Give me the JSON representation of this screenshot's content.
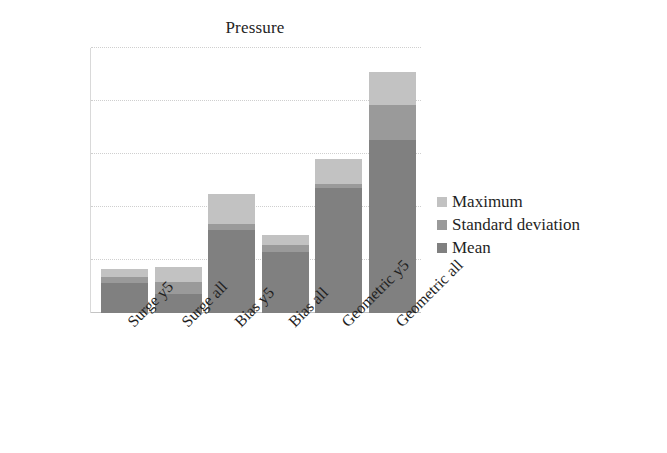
{
  "chart_data": {
    "type": "bar",
    "subtype": "stacked",
    "title": "Pressure",
    "xlabel": "",
    "ylabel": "",
    "ylim": [
      2750,
      3000
    ],
    "yticks": [
      2750,
      2800,
      2850,
      2900,
      2950,
      3000
    ],
    "ytick_labels": [
      "2750",
      "2800",
      "2850",
      "2900",
      "2950",
      "3000"
    ],
    "grid": true,
    "grid_axis": "y",
    "legend_position": "right",
    "categories": [
      "Surge y5",
      "Surge all",
      "Bias y5",
      "Bias all",
      "Geometric y5",
      "Geometric all"
    ],
    "series": [
      {
        "name": "Mean",
        "color": "#808080",
        "values": [
          2778,
          2768,
          2828,
          2808,
          2868,
          2913
        ]
      },
      {
        "name": "Standard deviation",
        "color": "#9a9a9a",
        "values": [
          2784,
          2779,
          2834,
          2814,
          2872,
          2946
        ]
      },
      {
        "name": "Maximum",
        "color": "#c2c2c2",
        "values": [
          2792,
          2793,
          2862,
          2824,
          2895,
          2977
        ]
      }
    ],
    "stack_order_bottom_to_top": [
      "Mean",
      "Standard deviation",
      "Maximum"
    ]
  },
  "legend": {
    "items": [
      {
        "label": "Maximum",
        "color": "#c2c2c2"
      },
      {
        "label": "Standard deviation",
        "color": "#9a9a9a"
      },
      {
        "label": "Mean",
        "color": "#808080"
      }
    ]
  }
}
